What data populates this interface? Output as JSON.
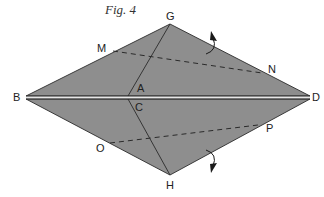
{
  "figure": {
    "title": "Fig. 4",
    "fill_color": "#8e8e8e",
    "stroke_color": "#2a2a2a",
    "crease_color": "#d8d8d8"
  },
  "points": {
    "G": {
      "label": "G",
      "x": 170,
      "y": 24
    },
    "H": {
      "label": "H",
      "x": 170,
      "y": 175
    },
    "B": {
      "label": "B",
      "x": 26,
      "y": 97
    },
    "D": {
      "label": "D",
      "x": 310,
      "y": 97
    },
    "A": {
      "label": "A",
      "x": 128,
      "y": 96
    },
    "C": {
      "label": "C",
      "x": 128,
      "y": 99
    },
    "M": {
      "label": "M",
      "x": 113,
      "y": 51
    },
    "N": {
      "label": "N",
      "x": 262,
      "y": 73
    },
    "O": {
      "label": "O",
      "x": 110,
      "y": 143
    },
    "P": {
      "label": "P",
      "x": 258,
      "y": 125
    }
  },
  "labels": {
    "G": "G",
    "H": "H",
    "B": "B",
    "D": "D",
    "A": "A",
    "C": "C",
    "M": "M",
    "N": "N",
    "O": "O",
    "P": "P"
  },
  "arrows": [
    {
      "name": "fold-up-arrow",
      "direction": "up"
    },
    {
      "name": "fold-down-arrow",
      "direction": "down"
    }
  ]
}
